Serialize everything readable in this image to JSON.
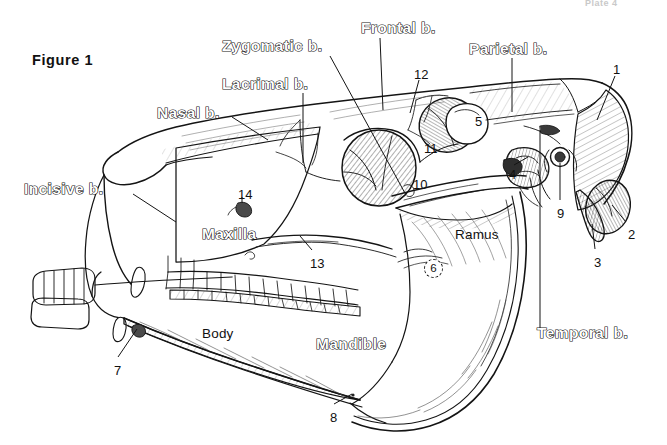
{
  "plate": {
    "header": "Plate 4",
    "figure_label": "Figure 1",
    "background_color": "#ffffff",
    "ink_color": "#141414"
  },
  "subject": {
    "title": "Horse skull, lateral view",
    "style": "pen-and-ink line drawing with cross-hatch shading"
  },
  "bone_labels": [
    {
      "id": "incisive",
      "text": "Incisive b.",
      "x": 24,
      "y": 181,
      "style": "outline"
    },
    {
      "id": "nasal",
      "text": "Nasal b.",
      "x": 157,
      "y": 105,
      "style": "outline"
    },
    {
      "id": "lacrimal",
      "text": "Lacrimal b.",
      "x": 222,
      "y": 76,
      "style": "outline"
    },
    {
      "id": "zygomatic",
      "text": "Zygomatic b.",
      "x": 222,
      "y": 38,
      "style": "outline"
    },
    {
      "id": "frontal",
      "text": "Frontal b.",
      "x": 361,
      "y": 20,
      "style": "outline"
    },
    {
      "id": "parietal",
      "text": "Parietal b.",
      "x": 469,
      "y": 41,
      "style": "outline"
    },
    {
      "id": "temporal",
      "text": "Temporal b.",
      "x": 537,
      "y": 325,
      "style": "outline"
    },
    {
      "id": "maxilla",
      "text": "Maxilla",
      "x": 202,
      "y": 226,
      "style": "outline"
    },
    {
      "id": "mandible",
      "text": "Mandible",
      "x": 316,
      "y": 336,
      "style": "outline"
    }
  ],
  "region_labels": [
    {
      "id": "body",
      "text": "Body",
      "x": 202,
      "y": 327,
      "style": "plain"
    },
    {
      "id": "ramus",
      "text": "Ramus",
      "x": 455,
      "y": 228,
      "style": "plain"
    }
  ],
  "numbered_markers": [
    {
      "n": "1",
      "x": 613,
      "y": 63,
      "circled": false
    },
    {
      "n": "2",
      "x": 628,
      "y": 228,
      "circled": false
    },
    {
      "n": "3",
      "x": 594,
      "y": 256,
      "circled": false
    },
    {
      "n": "4",
      "x": 509,
      "y": 168,
      "circled": false
    },
    {
      "n": "5",
      "x": 475,
      "y": 115,
      "circled": false
    },
    {
      "n": "6",
      "x": 424,
      "y": 259,
      "circled": true
    },
    {
      "n": "7",
      "x": 114,
      "y": 364,
      "circled": false
    },
    {
      "n": "8",
      "x": 330,
      "y": 411,
      "circled": false
    },
    {
      "n": "9",
      "x": 557,
      "y": 207,
      "circled": false
    },
    {
      "n": "10",
      "x": 413,
      "y": 178,
      "circled": false
    },
    {
      "n": "11",
      "x": 424,
      "y": 142,
      "circled": false
    },
    {
      "n": "12",
      "x": 414,
      "y": 68,
      "circled": false
    },
    {
      "n": "13",
      "x": 310,
      "y": 257,
      "circled": false
    },
    {
      "n": "14",
      "x": 238,
      "y": 188,
      "circled": false
    }
  ],
  "leader_lines": [
    {
      "from": "Incisive b.",
      "x1": 133,
      "y1": 194,
      "x2": 176,
      "y2": 222
    },
    {
      "from": "Nasal b.",
      "x1": 232,
      "y1": 117,
      "x2": 268,
      "y2": 140
    },
    {
      "from": "Lacrimal b.",
      "x1": 303,
      "y1": 93,
      "x2": 303,
      "y2": 163
    },
    {
      "from": "Zygomatic b.",
      "x1": 330,
      "y1": 56,
      "x2": 406,
      "y2": 195
    },
    {
      "from": "Frontal b.",
      "x1": 380,
      "y1": 38,
      "x2": 383,
      "y2": 110
    },
    {
      "from": "Parietal b.",
      "x1": 512,
      "y1": 58,
      "x2": 512,
      "y2": 112
    },
    {
      "from": "Temporal b.",
      "x1": 540,
      "y1": 330,
      "x2": 540,
      "y2": 130
    },
    {
      "from": "12",
      "x1": 419,
      "y1": 80,
      "x2": 410,
      "y2": 113
    },
    {
      "from": "1",
      "x1": 615,
      "y1": 76,
      "x2": 597,
      "y2": 120
    },
    {
      "from": "2",
      "x1": 626,
      "y1": 222,
      "x2": 612,
      "y2": 205
    },
    {
      "from": "3",
      "x1": 595,
      "y1": 249,
      "x2": 592,
      "y2": 224
    },
    {
      "from": "4",
      "x1": 514,
      "y1": 165,
      "x2": 528,
      "y2": 157
    },
    {
      "from": "7",
      "x1": 118,
      "y1": 357,
      "x2": 137,
      "y2": 329
    },
    {
      "from": "8",
      "x1": 334,
      "y1": 404,
      "x2": 352,
      "y2": 394
    },
    {
      "from": "9",
      "x1": 560,
      "y1": 200,
      "x2": 560,
      "y2": 163
    },
    {
      "from": "13",
      "x1": 312,
      "y1": 250,
      "x2": 300,
      "y2": 236
    },
    {
      "from": "14",
      "x1": 242,
      "y1": 197,
      "x2": 242,
      "y2": 203
    }
  ]
}
